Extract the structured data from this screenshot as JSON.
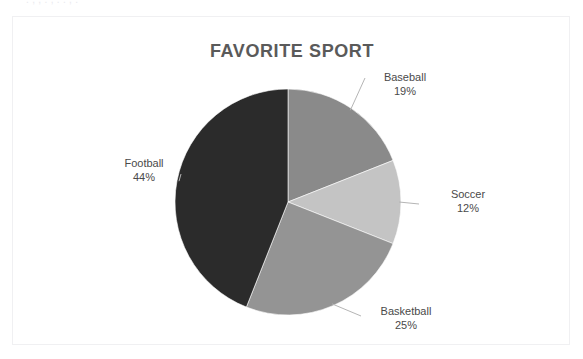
{
  "clipped_header_text": "  .   ,      ,        .  ,    .      .    ,     .     ",
  "chart": {
    "title": "FAVORITE SPORT",
    "frame_color": "#f0f0f2",
    "title_color": "#5a5a5a",
    "label_color": "#4a4a4a",
    "leader_color": "#b5b5b5"
  },
  "chart_data": {
    "type": "pie",
    "title": "FAVORITE SPORT",
    "xlabel": "",
    "ylabel": "",
    "legend": "none",
    "grid": false,
    "start_angle_deg": 0,
    "direction": "clockwise",
    "categories": [
      "Baseball",
      "Soccer",
      "Basketball",
      "Football"
    ],
    "values": [
      19,
      12,
      25,
      44
    ],
    "value_unit": "%",
    "colors": [
      "#8a8a8a",
      "#c4c4c4",
      "#949494",
      "#2b2b2b"
    ],
    "slices": [
      {
        "label": "Baseball",
        "value": 19,
        "display": "19%",
        "color": "#8a8a8a"
      },
      {
        "label": "Soccer",
        "value": 12,
        "display": "12%",
        "color": "#c4c4c4"
      },
      {
        "label": "Basketball",
        "value": 25,
        "display": "25%",
        "color": "#949494"
      },
      {
        "label": "Football",
        "value": 44,
        "display": "44%",
        "color": "#2b2b2b"
      }
    ]
  }
}
